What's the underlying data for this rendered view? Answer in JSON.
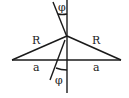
{
  "diagram": {
    "labels": {
      "phi_top": "φ",
      "phi_bottom": "φ",
      "R_left": "R",
      "R_right": "R",
      "a_left": "a",
      "a_right": "a"
    },
    "colors": {
      "line": "#1a1a1a",
      "background": "#ffffff"
    }
  }
}
